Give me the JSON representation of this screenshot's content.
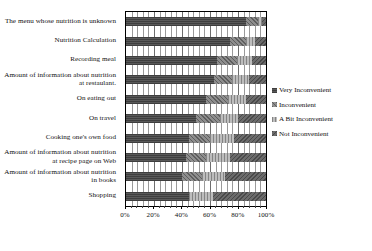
{
  "chart_data": {
    "type": "bar",
    "orientation": "horizontal",
    "stacked": true,
    "normalized_percent": true,
    "title": "",
    "xlabel": "",
    "ylabel": "",
    "xlim": [
      0,
      100
    ],
    "grid": true,
    "legend_position": "right",
    "categories": [
      "The menu whose nutrition is unknown",
      "Nutrition Calculation",
      "Recording meal",
      "Amount of information about nutrition at restaulant.",
      "On eating out",
      "On travel",
      "Cooking one's own food",
      "Amount of information about nutrition at recipe page on Web",
      "Amount of information about nutrition in books",
      "Shopping"
    ],
    "tick_labels": [
      "0%",
      "20%",
      "40%",
      "60%",
      "80%",
      "100%"
    ],
    "tick_values": [
      0,
      20,
      40,
      60,
      80,
      100
    ],
    "series": [
      {
        "name": "Very Inconvenient",
        "color": "#595959",
        "values": [
          86,
          74,
          65,
          63,
          57,
          50,
          45,
          43,
          40,
          45
        ]
      },
      {
        "name": "Inconvenient",
        "color": "#8e8e8e",
        "values": [
          8,
          12,
          14,
          13,
          16,
          17,
          15,
          14,
          14,
          0
        ]
      },
      {
        "name": "A Bit Inconvenient",
        "color": "#bdbdbd",
        "values": [
          3,
          6,
          11,
          12,
          13,
          13,
          17,
          17,
          17,
          17
        ]
      },
      {
        "name": "Not Inconvenient",
        "color": "#6b6b6b",
        "values": [
          3,
          8,
          10,
          12,
          14,
          20,
          23,
          26,
          29,
          38
        ]
      }
    ]
  },
  "legend": {
    "items": [
      {
        "label": "Very Inconvenient"
      },
      {
        "label": "Inconvenient"
      },
      {
        "label": "A Bit Inconvenient"
      },
      {
        "label": "Not Inconvenient"
      }
    ]
  }
}
